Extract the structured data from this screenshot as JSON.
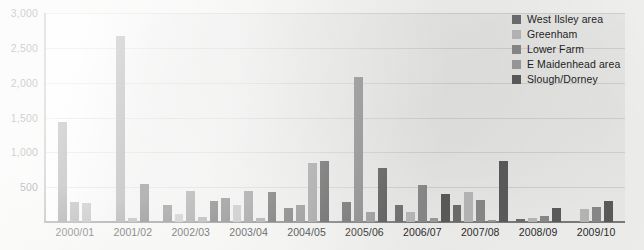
{
  "chart_data": {
    "type": "bar",
    "title": "",
    "xlabel": "",
    "ylabel": "",
    "ylim": [
      0,
      3000
    ],
    "grid": true,
    "legend_position": "top-right",
    "categories": [
      "2000/01",
      "2001/02",
      "2002/03",
      "2003/04",
      "2004/05",
      "2005/06",
      "2006/07",
      "2007/08",
      "2008/09",
      "2009/10"
    ],
    "y_ticks": [
      "0",
      "500",
      "1,000",
      "1,500",
      "2,000",
      "2,500",
      "3,000"
    ],
    "y_tick_values": [
      0,
      500,
      1000,
      1500,
      2000,
      2500,
      3000
    ],
    "series": [
      {
        "name": "West Ilsley area",
        "color": "#6e6e6e",
        "values": [
          1430,
          0,
          240,
          350,
          200,
          290,
          240,
          250,
          40,
          0
        ]
      },
      {
        "name": "Greenham",
        "color": "#b9b9b9",
        "values": [
          0,
          0,
          110,
          250,
          0,
          0,
          150,
          430,
          60,
          180
        ]
      },
      {
        "name": "Lower Farm",
        "color": "#8a8a8a",
        "values": [
          290,
          2670,
          450,
          450,
          250,
          2080,
          530,
          320,
          90,
          220
        ]
      },
      {
        "name": "E Maidenhead area",
        "color": "#9d9d9d",
        "values": [
          270,
          60,
          70,
          60,
          850,
          150,
          60,
          30,
          0,
          0
        ]
      },
      {
        "name": "Slough/Dorney",
        "color": "#5c5c5c",
        "values": [
          0,
          550,
          300,
          430,
          870,
          780,
          400,
          870,
          200,
          300
        ]
      }
    ]
  },
  "legend": {
    "items": [
      {
        "label": "West Ilsley area",
        "color": "#6e6e6e"
      },
      {
        "label": "Greenham",
        "color": "#b9b9b9"
      },
      {
        "label": "Lower Farm",
        "color": "#8a8a8a"
      },
      {
        "label": "E Maidenhead area",
        "color": "#9d9d9d"
      },
      {
        "label": "Slough/Dorney",
        "color": "#5c5c5c"
      }
    ]
  }
}
